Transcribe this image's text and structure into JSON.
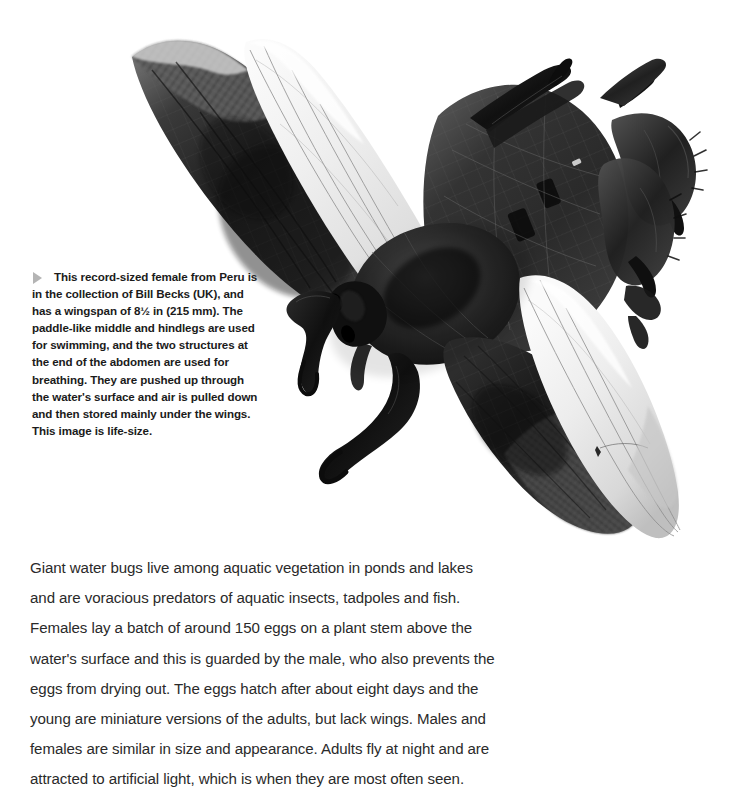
{
  "page": {
    "background_color": "#ffffff",
    "width": 737,
    "height": 763
  },
  "figure": {
    "name": "giant-water-bug-specimen-photograph",
    "alt_description": "Black and white top-down photograph of a pinned giant water bug (Lethocerus) specimen with wings spread, showing dark forewings, pale translucent hindwings, raptorial forelegs and paddle-like swimming legs",
    "subject": "Giant water bug",
    "colors": {
      "background": "#ffffff",
      "body_dark": "#1d1d1d",
      "body_mid": "#3f3f3f",
      "wing_pale": "#ececec",
      "wing_pale_shadow": "#d6d6d6",
      "membrane_hatch": "#6e6e6e",
      "leg_dark": "#111111"
    }
  },
  "caption": {
    "bullet_icon": "triangle-right-icon",
    "bullet_color": "#b4b4b4",
    "text": "This record-sized female from Peru is in the collection of Bill Becks (UK), and has a wingspan of 8½ in (215 mm). The paddle-like middle and hindlegs are used for swimming, and the two structures at the end of the abdomen are used for breathing. They are pushed up through the water's surface and air is pulled down and then stored mainly under the wings. This image is life-size.",
    "lines": [
      "This record-sized female from Peru",
      "is in the collection of Bill Becks (UK),",
      "and has a wingspan of 8½ in (215 mm).",
      "The paddle-like middle and hindlegs",
      "are used for swimming, and the two",
      "structures at the end of the abdomen",
      "are used for breathing. They are",
      "pushed up through the water's surface",
      "and air is pulled down and then stored",
      "mainly under the wings. This image is",
      "life-size."
    ]
  },
  "body": {
    "paragraph": "Giant water bugs live among aquatic vegetation in ponds and lakes and are voracious predators of aquatic insects, tadpoles and fish. Females lay a batch of around 150 eggs on a plant stem above the water's surface and this is guarded by the male, who also prevents the eggs from drying out. The eggs hatch after about eight days and the young are miniature versions of the adults, but lack wings. Males and females are similar in size and appearance. Adults fly at night and are attracted to artificial light, which is when they are most often seen.",
    "lines": [
      "Giant water bugs live among aquatic vegetation in ponds and lakes",
      "and are voracious predators of aquatic insects, tadpoles and fish.",
      "Females lay a batch of around 150 eggs on a plant stem above the",
      "water's surface and this is guarded by the male, who also prevents the",
      "eggs from drying out. The eggs hatch after about eight days and the",
      "young are miniature versions of the adults, but lack wings. Males and",
      "females are similar in size and appearance. Adults fly at night and are",
      "attracted to artificial light, which is when they are most often seen."
    ]
  }
}
